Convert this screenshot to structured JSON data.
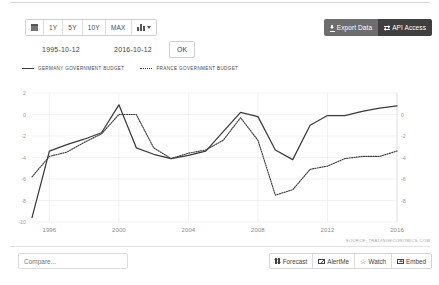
{
  "toolbar": {
    "range_buttons": [
      {
        "name": "calendar",
        "label": ""
      },
      {
        "name": "1y",
        "label": "1Y"
      },
      {
        "name": "5y",
        "label": "5Y"
      },
      {
        "name": "10y",
        "label": "10Y"
      },
      {
        "name": "max",
        "label": "MAX"
      },
      {
        "name": "chart-type",
        "label": ""
      }
    ],
    "date_from": "1995-10-12",
    "date_to": "2016-10-12",
    "ok_label": "OK",
    "export_label": "Export Data",
    "api_label": "API Access",
    "export_bg": "#6d6d6d",
    "api_bg": "#3f3f3f"
  },
  "bottom": {
    "compare_placeholder": "Compare...",
    "compare_value": "",
    "buttons": [
      {
        "name": "forecast",
        "label": "Forecast"
      },
      {
        "name": "alertme",
        "label": "AlertMe"
      },
      {
        "name": "watch",
        "label": "Watch"
      },
      {
        "name": "embed",
        "label": "Embed"
      }
    ]
  },
  "source_note": "SOURCE: TRADINGECONOMICS.COM",
  "chart_data": {
    "type": "line",
    "title": "",
    "xlabel": "",
    "ylabel": "",
    "grid": true,
    "legend_position": "top-left",
    "xlim": [
      1995,
      2016
    ],
    "ylim": [
      -10,
      2
    ],
    "yticks": [
      2,
      0,
      -2,
      -4,
      -6,
      -8,
      -10
    ],
    "ytick_labels_left": [
      "2",
      "0",
      "-2",
      "-4",
      "-6",
      "-8",
      "-10"
    ],
    "yticks_right": [
      0,
      -2,
      -4,
      -6,
      -8
    ],
    "ytick_labels_right": [
      "0",
      "-2",
      "-4",
      "-6",
      "-8"
    ],
    "xticks": [
      1996,
      2000,
      2004,
      2008,
      2012,
      2016
    ],
    "xtick_labels": [
      "1996",
      "2000",
      "2004",
      "2008",
      "2012",
      "2016"
    ],
    "line_color": "#3b3b3b",
    "series": [
      {
        "name": "GERMANY GOVERNMENT BUDGET",
        "style": "solid",
        "x": [
          1995,
          1996,
          1997,
          1998,
          1999,
          2000,
          2001,
          2002,
          2003,
          2004,
          2005,
          2006,
          2007,
          2008,
          2009,
          2010,
          2011,
          2012,
          2013,
          2014,
          2015,
          2016
        ],
        "values": [
          -9.6,
          -3.4,
          -2.8,
          -2.3,
          -1.7,
          0.9,
          -3.1,
          -3.7,
          -4.1,
          -3.8,
          -3.4,
          -1.6,
          0.2,
          -0.2,
          -3.3,
          -4.2,
          -1.0,
          -0.1,
          -0.1,
          0.3,
          0.6,
          0.8
        ]
      },
      {
        "name": "FRANCE GOVERNMENT BUDGET",
        "style": "dotted",
        "x": [
          1995,
          1996,
          1997,
          1998,
          1999,
          2000,
          2001,
          2002,
          2003,
          2004,
          2005,
          2006,
          2007,
          2008,
          2009,
          2010,
          2011,
          2012,
          2013,
          2014,
          2015,
          2016
        ],
        "values": [
          -5.8,
          -3.9,
          -3.5,
          -2.6,
          -1.8,
          0.0,
          0.0,
          -3.1,
          -4.1,
          -3.6,
          -3.3,
          -2.4,
          -0.3,
          -2.4,
          -7.5,
          -7.0,
          -5.1,
          -4.8,
          -4.1,
          -3.9,
          -3.9,
          -3.4
        ]
      }
    ]
  }
}
